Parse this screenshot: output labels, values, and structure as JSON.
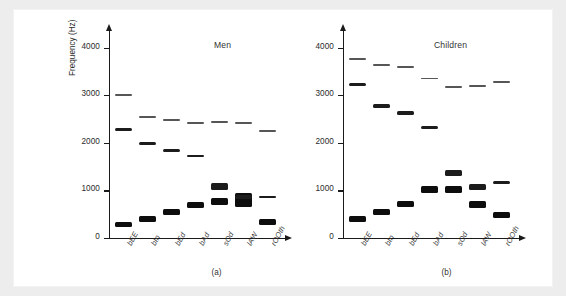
{
  "figure": {
    "y_axis_title": "Frequency (Hz)",
    "y_ticks": [
      "0",
      "1000",
      "2000",
      "3000",
      "4000"
    ],
    "panel_a_title": "Men",
    "panel_b_title": "Children",
    "panel_a_caption": "(a)",
    "panel_b_caption": "(b)",
    "colors": {
      "ink": "#0d0d0d",
      "f3_gray": "#565656",
      "plate": "#ffffff",
      "frame": "#ededed"
    }
  },
  "chart_data": {
    "type": "bar",
    "xlabel": "",
    "ylabel": "Frequency (Hz)",
    "ylim": [
      0,
      4200
    ],
    "yticks": [
      0,
      1000,
      2000,
      3000,
      4000
    ],
    "grid": false,
    "legend": "none",
    "categories": [
      "bEE",
      "bIn",
      "bEd",
      "bAd",
      "sOd",
      "lAW",
      "rOOth"
    ],
    "panels": [
      {
        "name": "Men",
        "caption": "(a)",
        "series": [
          {
            "name": "F1",
            "values": [
              280,
              400,
              550,
              690,
              760,
              800,
              330
            ],
            "bandwidths": [
              110,
              120,
              115,
              120,
              150,
              290,
              130
            ]
          },
          {
            "name": "F2",
            "values": [
              2280,
              1990,
              1840,
              1720,
              1080,
              860,
              870
            ],
            "bandwidths": [
              55,
              55,
              55,
              55,
              130,
              90,
              40
            ]
          },
          {
            "name": "F3",
            "values": [
              3010,
              2550,
              2470,
              2410,
              2430,
              2410,
              2240
            ],
            "bandwidths": [
              40,
              40,
              40,
              40,
              40,
              40,
              40
            ]
          }
        ]
      },
      {
        "name": "Children",
        "caption": "(b)",
        "series": [
          {
            "name": "F1",
            "values": [
              400,
              550,
              720,
              1010,
              1020,
              710,
              480
            ],
            "bandwidths": [
              120,
              125,
              130,
              145,
              150,
              150,
              130
            ]
          },
          {
            "name": "F2",
            "values": [
              3220,
              2770,
              2630,
              2320,
              1360,
              1080,
              1160
            ],
            "bandwidths": [
              70,
              70,
              75,
              75,
              120,
              125,
              60
            ]
          },
          {
            "name": "F3",
            "values": [
              3760,
              3630,
              3600,
              3350,
              3180,
              3200,
              3280
            ],
            "bandwidths": [
              40,
              40,
              40,
              40,
              40,
              40,
              40
            ]
          }
        ]
      }
    ]
  }
}
